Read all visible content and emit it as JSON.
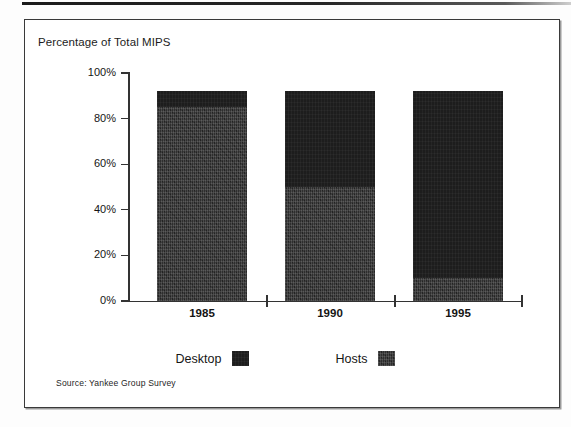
{
  "chart_data": {
    "type": "bar",
    "title": "Percentage of Total MIPS",
    "xlabel": "",
    "ylabel": "Percentage of Total MIPS",
    "categories": [
      "1985",
      "1990",
      "1995"
    ],
    "ytick_labels": [
      "100%",
      "80%",
      "60%",
      "40%",
      "20%",
      "0%"
    ],
    "ytick_values": [
      100,
      80,
      60,
      40,
      20,
      0
    ],
    "ylim": [
      0,
      100
    ],
    "stacked": true,
    "grid": false,
    "legend_position": "bottom",
    "series": [
      {
        "name": "Desktop",
        "color": "#1d1d1d",
        "values": [
          7,
          42,
          82
        ]
      },
      {
        "name": "Hosts",
        "color": "#2e2e2e",
        "values": [
          85,
          50,
          10
        ]
      }
    ],
    "totals": [
      92,
      92,
      92
    ],
    "annotations": [
      "Source: Yankee Group Survey"
    ]
  },
  "chart": {
    "title": "Percentage of Total MIPS",
    "source_note": "Source: Yankee Group Survey",
    "y_ticks": [
      {
        "label": "100%",
        "value": 100
      },
      {
        "label": "80%",
        "value": 80
      },
      {
        "label": "60%",
        "value": 60
      },
      {
        "label": "40%",
        "value": 40
      },
      {
        "label": "20%",
        "value": 20
      },
      {
        "label": "0%",
        "value": 0
      }
    ],
    "x_categories": [
      {
        "label": "1985",
        "desktop": 7,
        "hosts": 85
      },
      {
        "label": "1990",
        "desktop": 42,
        "hosts": 50
      },
      {
        "label": "1995",
        "desktop": 82,
        "hosts": 10
      }
    ],
    "legend": [
      {
        "label": "Desktop",
        "color": "#1d1d1d"
      },
      {
        "label": "Hosts",
        "color": "#2e2e2e"
      }
    ]
  }
}
